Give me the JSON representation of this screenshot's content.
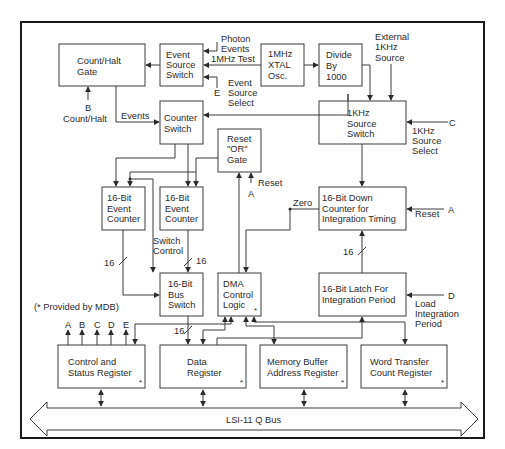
{
  "diagram": {
    "footnote": "(* Provided by MDB)",
    "bus_label": "LSI-11 Q Bus",
    "blocks": {
      "count_halt_gate": [
        "Count/Halt",
        "Gate"
      ],
      "event_source_switch": [
        "Event",
        "Source",
        "Switch"
      ],
      "xtal_osc": [
        "1MHz",
        "XTAL",
        "Osc."
      ],
      "divide_by_1000": [
        "Divide",
        "By",
        "1000"
      ],
      "counter_switch": [
        "Counter",
        "Switch"
      ],
      "reset_or_gate": [
        "Reset",
        "\"OR\"",
        "Gate"
      ],
      "khz_source_switch": [
        "1KHz",
        "Source",
        "Switch"
      ],
      "event_counter_1": [
        "16-Bit",
        "Event",
        "Counter"
      ],
      "event_counter_2": [
        "16-Bit",
        "Event",
        "Counter"
      ],
      "down_counter": [
        "16-Bit Down",
        "Counter for",
        "Integration Timing"
      ],
      "bus_switch": [
        "16-Bit",
        "Bus",
        "Switch"
      ],
      "dma_control_logic": [
        "DMA",
        "Control",
        "Logic"
      ],
      "latch": [
        "16-Bit Latch For",
        "Integration Period"
      ],
      "csr": [
        "Control and",
        "Status Register"
      ],
      "data_register": [
        "Data",
        "Register"
      ],
      "mbar": [
        "Memory Buffer",
        "Address Register"
      ],
      "wtcr": [
        "Word Transfer",
        "Count Register"
      ]
    },
    "mdb_marker": "*",
    "labels": {
      "photon_events": [
        "Photon",
        "Events"
      ],
      "mhz_test": "1MHz Test",
      "event_source_select": [
        "Event",
        "Source",
        "Select"
      ],
      "e": "E",
      "b": "B",
      "count_halt": "Count/Halt",
      "events": "Events",
      "external_1khz": [
        "External",
        "1KHz",
        "Source"
      ],
      "c": "C",
      "khz_source_select": [
        "1KHz",
        "Source",
        "Select"
      ],
      "reset": "Reset",
      "a": "A",
      "zero": "Zero",
      "switch_control": [
        "Switch",
        "Control"
      ],
      "sixteen": "16",
      "d": "D",
      "load_integration_period": [
        "Load",
        "Integration",
        "Period"
      ],
      "csr_outputs": [
        "A",
        "B",
        "C",
        "D",
        "E"
      ]
    }
  }
}
